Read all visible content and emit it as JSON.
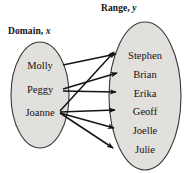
{
  "figure": {
    "type": "mapping-diagram",
    "domain_header": "Domain,",
    "domain_header_var": "x",
    "range_header": "Range,",
    "range_header_var": "y",
    "colors": {
      "ellipse_fill": "#e2e0dd",
      "ellipse_stroke": "#3a3734",
      "arrow": "#141414",
      "text": "#15100e",
      "background": "#ffffff"
    }
  },
  "domain": {
    "label": "Domain, x",
    "items": [
      {
        "id": "molly",
        "label": "Molly",
        "cx": 40,
        "cy": 65
      },
      {
        "id": "peggy",
        "label": "Peggy",
        "cx": 40,
        "cy": 89
      },
      {
        "id": "joanne",
        "label": "Joanne",
        "cx": 40,
        "cy": 112
      }
    ],
    "ellipse": {
      "cx": 40,
      "cy": 95,
      "rx": 29,
      "ry": 53
    }
  },
  "range": {
    "label": "Range, y",
    "items": [
      {
        "id": "stephen",
        "label": "Stephen",
        "cx": 145,
        "cy": 55
      },
      {
        "id": "brian",
        "label": "Brian",
        "cx": 145,
        "cy": 74
      },
      {
        "id": "erika",
        "label": "Erika",
        "cx": 145,
        "cy": 93
      },
      {
        "id": "geoff",
        "label": "Geoff",
        "cx": 145,
        "cy": 111
      },
      {
        "id": "joelle",
        "label": "Joelle",
        "cx": 145,
        "cy": 130
      },
      {
        "id": "julie",
        "label": "Julie",
        "cx": 145,
        "cy": 149
      }
    ],
    "ellipse": {
      "cx": 145,
      "cy": 96,
      "rx": 36,
      "ry": 74
    }
  },
  "mappings": [
    {
      "from": "molly",
      "to": "stephen",
      "x1": 63,
      "y1": 65,
      "x2": 116,
      "y2": 54
    },
    {
      "from": "peggy",
      "to": "brian",
      "x1": 63,
      "y1": 89,
      "x2": 117,
      "y2": 73
    },
    {
      "from": "peggy",
      "to": "erika",
      "x1": 63,
      "y1": 91,
      "x2": 116,
      "y2": 92
    },
    {
      "from": "joanne",
      "to": "stephen",
      "x1": 60,
      "y1": 111,
      "x2": 114,
      "y2": 52
    },
    {
      "from": "joanne",
      "to": "geoff",
      "x1": 60,
      "y1": 112,
      "x2": 115,
      "y2": 110
    },
    {
      "from": "joanne",
      "to": "joelle",
      "x1": 60,
      "y1": 113,
      "x2": 114,
      "y2": 128
    },
    {
      "from": "joanne",
      "to": "julie",
      "x1": 60,
      "y1": 113,
      "x2": 113,
      "y2": 148
    }
  ]
}
